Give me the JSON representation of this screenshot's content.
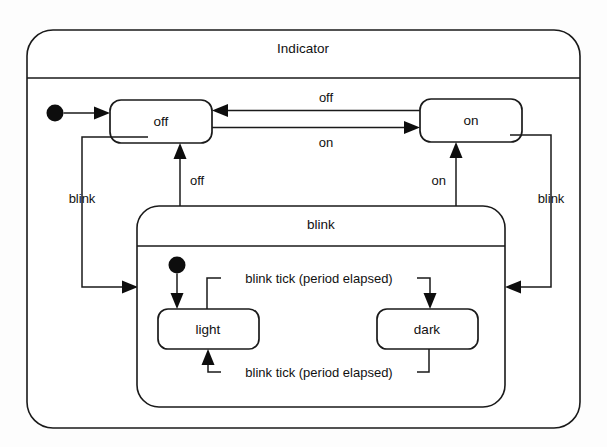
{
  "diagram": {
    "kind": "statechart",
    "canvas": {
      "width": 607,
      "height": 447
    },
    "background_color": "#fdfdfd",
    "line_color": "#1a1a1a",
    "text_color": "#111111"
  },
  "outer_state": {
    "name": "Indicator",
    "title": "Indicator"
  },
  "composite_state": {
    "name": "blink",
    "title": "blink"
  },
  "states": {
    "off": {
      "label": "off"
    },
    "on": {
      "label": "on"
    },
    "light": {
      "label": "light"
    },
    "dark": {
      "label": "dark"
    }
  },
  "transitions": {
    "on_to_off": {
      "label": "off"
    },
    "off_to_on": {
      "label": "on"
    },
    "off_to_blink": {
      "label": "blink"
    },
    "on_to_blink": {
      "label": "blink"
    },
    "blink_to_off": {
      "label": "off"
    },
    "blink_to_on": {
      "label": "on"
    },
    "light_to_dark": {
      "label": "blink tick (period elapsed)"
    },
    "dark_to_light": {
      "label": "blink tick (period elapsed)"
    }
  },
  "initial_markers": {
    "indicator_initial": {
      "target": "off"
    },
    "blink_initial": {
      "target": "light"
    }
  }
}
